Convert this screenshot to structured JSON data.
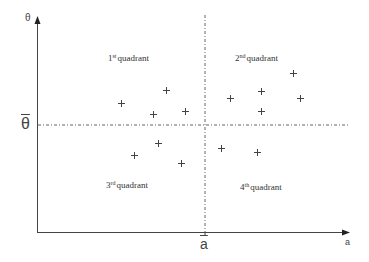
{
  "axes": {
    "x_label": "a",
    "y_label": "θ",
    "x_mean_label": "a",
    "y_mean_label": "θ"
  },
  "quadrants": [
    {
      "number": "1",
      "suffix": "st",
      "text": "quadrant"
    },
    {
      "number": "2",
      "suffix": "nd",
      "text": "quadrant"
    },
    {
      "number": "3",
      "suffix": "rd",
      "text": "quadrant"
    },
    {
      "number": "4",
      "suffix": "th",
      "text": "quadrant"
    }
  ],
  "colors": {
    "axis": "#444444",
    "dashed": "#666666",
    "marker": "#444444",
    "text": "#333333"
  },
  "points": [
    {
      "x": 121,
      "y": 103
    },
    {
      "x": 166,
      "y": 90
    },
    {
      "x": 153,
      "y": 114
    },
    {
      "x": 185,
      "y": 111
    },
    {
      "x": 230,
      "y": 98
    },
    {
      "x": 261,
      "y": 91
    },
    {
      "x": 261,
      "y": 111
    },
    {
      "x": 293,
      "y": 73
    },
    {
      "x": 300,
      "y": 98
    },
    {
      "x": 134,
      "y": 155
    },
    {
      "x": 158,
      "y": 143
    },
    {
      "x": 181,
      "y": 163
    },
    {
      "x": 221,
      "y": 148
    },
    {
      "x": 257,
      "y": 152
    }
  ]
}
